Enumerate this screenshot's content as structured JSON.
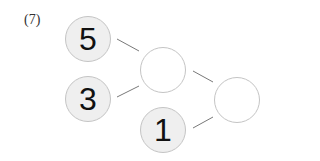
{
  "problem_label": "(7)",
  "nodes": {
    "top_left": {
      "value": "5"
    },
    "bottom_left": {
      "value": "3"
    },
    "middle_top": {
      "value": ""
    },
    "middle_bottom": {
      "value": "1"
    },
    "right": {
      "value": ""
    }
  },
  "colors": {
    "filled_bg": "#efefef",
    "border": "#c4c4c4",
    "line": "#555555"
  }
}
